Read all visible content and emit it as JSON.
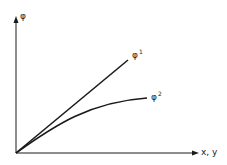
{
  "diagram": {
    "y_axis_label": "φ",
    "x_axis_label": "x, y",
    "curves": [
      {
        "name": "φ1",
        "symbol": "φ",
        "superscript": "1",
        "shape": "straight line"
      },
      {
        "name": "φ2",
        "symbol": "φ",
        "superscript": "2",
        "shape": "concave curve leveling off"
      }
    ]
  },
  "colors": {
    "stroke": "#1a1a1a",
    "background": "#ffffff"
  }
}
